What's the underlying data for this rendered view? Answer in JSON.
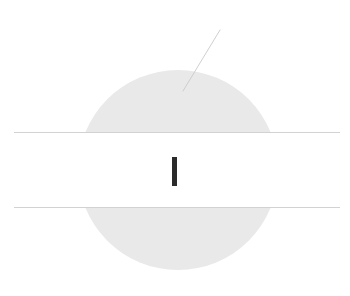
{
  "canvas": {
    "width": 350,
    "height": 296,
    "background_color": "#ffffff"
  },
  "shapes": {
    "disc": {
      "name": "gray-disc",
      "center_x": 178,
      "center_y": 170,
      "radius": 100,
      "fill_color": "#e9e9e9"
    },
    "band": {
      "name": "white-horizontal-band",
      "x": 0,
      "y": 133,
      "width": 350,
      "height": 75,
      "fill_color": "#ffffff"
    },
    "rule_top": {
      "name": "top-horizontal-rule",
      "x1": 14,
      "y1": 132.5,
      "x2": 340,
      "y2": 132.5,
      "stroke_color": "#d2d2d2",
      "stroke_width": 1.2
    },
    "rule_bottom": {
      "name": "bottom-horizontal-rule",
      "x1": 14,
      "y1": 207.5,
      "x2": 340,
      "y2": 207.5,
      "stroke_color": "#d2d2d2",
      "stroke_width": 1.2
    },
    "vertical_mark": {
      "name": "center-vertical-mark",
      "x": 172,
      "y": 157,
      "width": 5,
      "height": 29,
      "fill_color": "#2b2b2b"
    },
    "hairline": {
      "name": "diagonal-hairline",
      "x1": 220,
      "y1": 30,
      "x2": 183,
      "y2": 91,
      "stroke_color": "#c9c9c9",
      "stroke_width": 0.9
    }
  }
}
